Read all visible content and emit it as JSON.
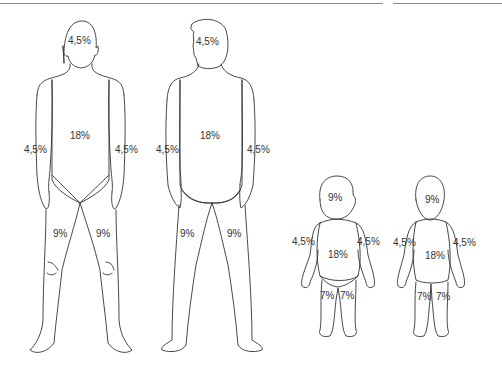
{
  "figures": [
    {
      "name": "adult-front",
      "labels": {
        "head": "4,5%",
        "trunk": "18%",
        "arm_left": "4,5%",
        "arm_right": "4,5%",
        "leg_left": "9%",
        "leg_right": "9%"
      }
    },
    {
      "name": "adult-back",
      "labels": {
        "head": "4,5%",
        "trunk": "18%",
        "arm_left": "4,5%",
        "arm_right": "4,5%",
        "leg_left": "9%",
        "leg_right": "9%"
      }
    },
    {
      "name": "child-front",
      "labels": {
        "head": "9%",
        "trunk": "18%",
        "arm_left": "4,5%",
        "arm_right": "4,5%",
        "leg_left": "7%",
        "leg_right": "7%"
      }
    },
    {
      "name": "child-back",
      "labels": {
        "head": "9%",
        "trunk": "18%",
        "arm_left": "4,5%",
        "arm_right": "4,5%",
        "leg_left": "7%",
        "leg_right": "7%"
      }
    }
  ],
  "colors": {
    "outline": "#333333",
    "top_rule": "#7d8f9c"
  }
}
